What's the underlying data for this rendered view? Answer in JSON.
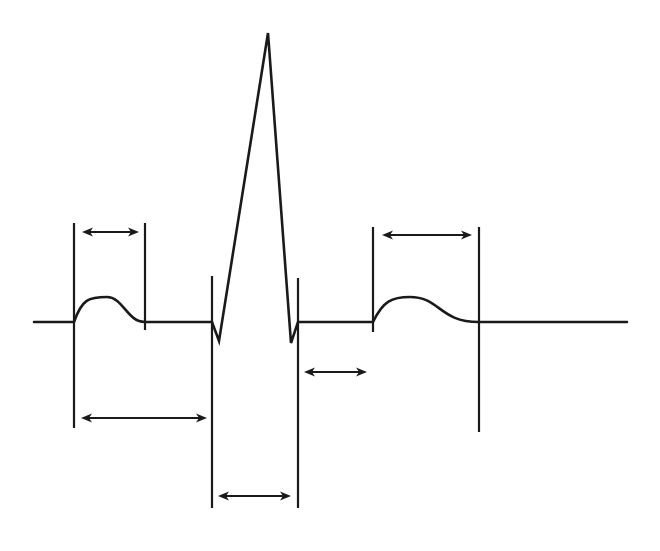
{
  "diagram": {
    "colors": {
      "background": "#ffffff",
      "ink": "#1a1a1a"
    },
    "waveform": {
      "baseline_y": 322,
      "baseline_start_x": 34,
      "baseline_end_x": 627,
      "components": [
        {
          "name": "P wave",
          "start": [
            74,
            322
          ],
          "peak": [
            107,
            297
          ],
          "end": [
            145,
            322
          ]
        },
        {
          "name": "Q",
          "point": [
            219,
            341
          ]
        },
        {
          "name": "R",
          "point": [
            268,
            33
          ]
        },
        {
          "name": "S",
          "point": [
            291,
            343
          ]
        },
        {
          "name": "T wave",
          "start": [
            373,
            322
          ],
          "peak": [
            410,
            297
          ],
          "end": [
            479,
            322
          ]
        }
      ]
    },
    "markers": [
      {
        "name": "p-wave-start-line",
        "x": 74,
        "y1": 223,
        "y2": 428
      },
      {
        "name": "p-wave-end-line",
        "x": 145,
        "y1": 223,
        "y2": 330
      },
      {
        "name": "qrs-start-line",
        "x": 212,
        "y1": 276,
        "y2": 508
      },
      {
        "name": "qrs-end-line",
        "x": 298,
        "y1": 278,
        "y2": 508
      },
      {
        "name": "t-wave-start-line",
        "x": 373,
        "y1": 227,
        "y2": 332
      },
      {
        "name": "t-wave-end-line",
        "x": 479,
        "y1": 227,
        "y2": 432
      }
    ],
    "intervals": [
      {
        "name": "p-wave-duration-arrow",
        "label": "P wave duration",
        "x1": 82,
        "x2": 139,
        "y": 232
      },
      {
        "name": "pr-interval-arrow",
        "label": "PR interval",
        "x1": 81,
        "x2": 207,
        "y": 418
      },
      {
        "name": "qrs-duration-arrow",
        "label": "QRS duration",
        "x1": 218,
        "x2": 291,
        "y": 496
      },
      {
        "name": "st-segment-arrow",
        "label": "ST segment",
        "x1": 304,
        "x2": 367,
        "y": 372
      },
      {
        "name": "t-wave-duration-arrow",
        "label": "T wave duration",
        "x1": 382,
        "x2": 472,
        "y": 235
      }
    ]
  }
}
